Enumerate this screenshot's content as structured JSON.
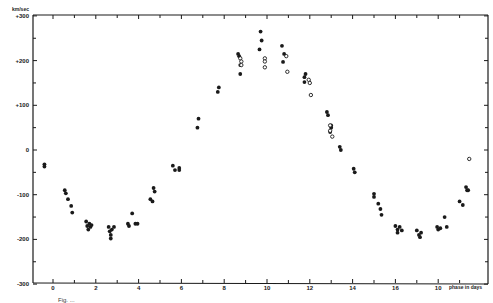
{
  "chart_data": {
    "type": "scatter",
    "title": "",
    "xlabel": "phase in days",
    "ylabel": "km/sec",
    "xlim": [
      -1,
      20.3
    ],
    "ylim": [
      -300,
      300
    ],
    "grid": false,
    "legend": null,
    "x_ticks": [
      {
        "value": 0,
        "label": "0"
      },
      {
        "value": 2,
        "label": "2"
      },
      {
        "value": 4,
        "label": "4"
      },
      {
        "value": 6,
        "label": "6"
      },
      {
        "value": 8,
        "label": "8"
      },
      {
        "value": 10,
        "label": "10"
      },
      {
        "value": 12,
        "label": "12"
      },
      {
        "value": 14,
        "label": "14"
      },
      {
        "value": 16,
        "label": "16"
      },
      {
        "value": 18,
        "label": "10"
      }
    ],
    "x_minor_ticks": [
      1,
      3,
      5,
      7,
      9,
      11,
      13,
      15,
      17,
      19
    ],
    "y_ticks": [
      {
        "value": 300,
        "label": "+300"
      },
      {
        "value": 200,
        "label": "+200"
      },
      {
        "value": 100,
        "label": "+100"
      },
      {
        "value": 0,
        "label": "0"
      },
      {
        "value": -100,
        "label": "-100"
      },
      {
        "value": -200,
        "label": "-200"
      },
      {
        "value": -300,
        "label": "-300"
      }
    ],
    "y_minor_ticks": [
      250,
      150,
      50,
      -50,
      -150,
      -250
    ],
    "series": [
      {
        "name": "filled circles",
        "marker": "filled",
        "points": [
          [
            -0.4,
            -32
          ],
          [
            -0.4,
            -37
          ],
          [
            0.55,
            -90
          ],
          [
            0.6,
            -97
          ],
          [
            0.7,
            -110
          ],
          [
            0.85,
            -125
          ],
          [
            0.9,
            -140
          ],
          [
            1.55,
            -160
          ],
          [
            1.6,
            -170
          ],
          [
            1.7,
            -165
          ],
          [
            1.75,
            -172
          ],
          [
            1.8,
            -168
          ],
          [
            1.65,
            -178
          ],
          [
            2.6,
            -172
          ],
          [
            2.65,
            -182
          ],
          [
            2.7,
            -190
          ],
          [
            2.75,
            -178
          ],
          [
            2.85,
            -172
          ],
          [
            2.7,
            -198
          ],
          [
            3.5,
            -165
          ],
          [
            3.55,
            -170
          ],
          [
            3.7,
            -142
          ],
          [
            3.85,
            -165
          ],
          [
            3.95,
            -165
          ],
          [
            4.55,
            -110
          ],
          [
            4.65,
            -115
          ],
          [
            4.7,
            -85
          ],
          [
            4.75,
            -93
          ],
          [
            5.6,
            -35
          ],
          [
            5.7,
            -45
          ],
          [
            5.9,
            -40
          ],
          [
            5.9,
            -45
          ],
          [
            6.8,
            70
          ],
          [
            6.75,
            50
          ],
          [
            7.75,
            140
          ],
          [
            7.7,
            130
          ],
          [
            8.65,
            215
          ],
          [
            8.7,
            210
          ],
          [
            8.75,
            190
          ],
          [
            8.75,
            170
          ],
          [
            9.7,
            265
          ],
          [
            9.75,
            245
          ],
          [
            9.65,
            225
          ],
          [
            10.7,
            233
          ],
          [
            10.8,
            215
          ],
          [
            10.75,
            197
          ],
          [
            11.8,
            170
          ],
          [
            11.75,
            163
          ],
          [
            11.75,
            152
          ],
          [
            12.8,
            85
          ],
          [
            12.85,
            78
          ],
          [
            13.0,
            55
          ],
          [
            13.0,
            50
          ],
          [
            12.95,
            40
          ],
          [
            13.4,
            7
          ],
          [
            13.45,
            0
          ],
          [
            14.05,
            -42
          ],
          [
            14.1,
            -50
          ],
          [
            15.0,
            -98
          ],
          [
            15.0,
            -105
          ],
          [
            15.2,
            -120
          ],
          [
            15.3,
            -132
          ],
          [
            15.35,
            -145
          ],
          [
            16.0,
            -170
          ],
          [
            16.1,
            -178
          ],
          [
            16.2,
            -172
          ],
          [
            16.3,
            -180
          ],
          [
            16.1,
            -185
          ],
          [
            17.0,
            -180
          ],
          [
            17.1,
            -190
          ],
          [
            17.2,
            -185
          ],
          [
            17.15,
            -195
          ],
          [
            17.95,
            -172
          ],
          [
            18.0,
            -178
          ],
          [
            18.1,
            -175
          ],
          [
            18.3,
            -150
          ],
          [
            18.4,
            -172
          ],
          [
            19.0,
            -115
          ],
          [
            19.15,
            -123
          ],
          [
            19.3,
            -83
          ],
          [
            19.35,
            -90
          ],
          [
            19.4,
            -90
          ]
        ]
      },
      {
        "name": "open circles",
        "marker": "open",
        "points": [
          [
            8.75,
            205
          ],
          [
            8.8,
            198
          ],
          [
            8.8,
            190
          ],
          [
            9.9,
            205
          ],
          [
            9.9,
            198
          ],
          [
            9.9,
            185
          ],
          [
            10.9,
            210
          ],
          [
            10.95,
            175
          ],
          [
            11.95,
            157
          ],
          [
            12.0,
            150
          ],
          [
            12.05,
            123
          ],
          [
            12.95,
            55
          ],
          [
            12.95,
            43
          ],
          [
            13.05,
            30
          ],
          [
            19.45,
            -20
          ]
        ]
      }
    ]
  },
  "axes": {
    "y_unit_label": "km/sec",
    "x_axis_title": "phase in days"
  },
  "caption": {
    "text": "Fig. ..."
  }
}
